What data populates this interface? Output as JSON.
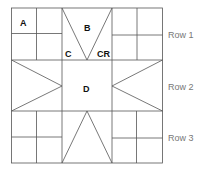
{
  "diagram": {
    "type": "quilt-block-layout",
    "stroke_color": "#555555",
    "patch_labels": {
      "a": "A",
      "b": "B",
      "c": "C",
      "cr": "CR",
      "d": "D"
    },
    "row_labels": [
      "Row 1",
      "Row 2",
      "Row 3"
    ]
  }
}
